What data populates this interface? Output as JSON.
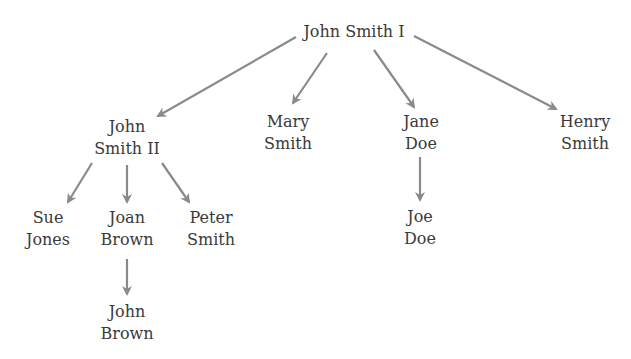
{
  "diagram": {
    "type": "family-tree",
    "edge_color": "#8a8a8a",
    "text_color": "#3a3a3a",
    "nodes": {
      "root": {
        "lines": [
          "John Smith I"
        ]
      },
      "john_smith_ii": {
        "lines": [
          "John",
          "Smith II"
        ]
      },
      "mary_smith": {
        "lines": [
          "Mary",
          "Smith"
        ]
      },
      "jane_doe": {
        "lines": [
          "Jane",
          "Doe"
        ]
      },
      "henry_smith": {
        "lines": [
          "Henry",
          "Smith"
        ]
      },
      "sue_jones": {
        "lines": [
          "Sue",
          "Jones"
        ]
      },
      "joan_brown": {
        "lines": [
          "Joan",
          "Brown"
        ]
      },
      "peter_smith": {
        "lines": [
          "Peter",
          "Smith"
        ]
      },
      "john_brown": {
        "lines": [
          "John",
          "Brown"
        ]
      },
      "joe_doe": {
        "lines": [
          "Joe",
          "Doe"
        ]
      }
    },
    "edges": [
      {
        "from": "John Smith I",
        "to": "John Smith II"
      },
      {
        "from": "John Smith I",
        "to": "Mary Smith"
      },
      {
        "from": "John Smith I",
        "to": "Jane Doe"
      },
      {
        "from": "John Smith I",
        "to": "Henry Smith"
      },
      {
        "from": "John Smith II",
        "to": "Sue Jones"
      },
      {
        "from": "John Smith II",
        "to": "Joan Brown"
      },
      {
        "from": "John Smith II",
        "to": "Peter Smith"
      },
      {
        "from": "Joan Brown",
        "to": "John Brown"
      },
      {
        "from": "Jane Doe",
        "to": "Joe Doe"
      }
    ]
  }
}
